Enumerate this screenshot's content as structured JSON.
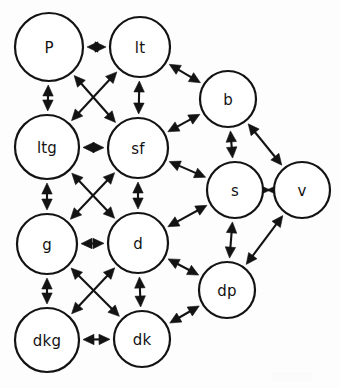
{
  "diagram": {
    "type": "directed-graph",
    "background_color": "#ffffff",
    "stroke_color": "#131313",
    "node_fill_color": "#ffffff",
    "arrow_style": "double-headed",
    "node_count": 12,
    "edge_count": 27,
    "nodes": [
      {
        "id": "P",
        "label": "P",
        "cx": 49,
        "cy": 47,
        "r": 34
      },
      {
        "id": "lt",
        "label": "lt",
        "cx": 140,
        "cy": 47,
        "r": 30
      },
      {
        "id": "b",
        "label": "b",
        "cx": 228,
        "cy": 99,
        "r": 28
      },
      {
        "id": "ltg",
        "label": "ltg",
        "cx": 47,
        "cy": 147,
        "r": 32
      },
      {
        "id": "sf",
        "label": "sf",
        "cx": 138,
        "cy": 148,
        "r": 30
      },
      {
        "id": "s",
        "label": "s",
        "cx": 235,
        "cy": 190,
        "r": 28
      },
      {
        "id": "v",
        "label": "v",
        "cx": 302,
        "cy": 190,
        "r": 28
      },
      {
        "id": "g",
        "label": "g",
        "cx": 47,
        "cy": 244,
        "r": 30
      },
      {
        "id": "d",
        "label": "d",
        "cx": 138,
        "cy": 243,
        "r": 30
      },
      {
        "id": "dp",
        "label": "dp",
        "cx": 227,
        "cy": 290,
        "r": 28
      },
      {
        "id": "dkg",
        "label": "dkg",
        "cx": 47,
        "cy": 340,
        "r": 32
      },
      {
        "id": "dk",
        "label": "dk",
        "cx": 142,
        "cy": 339,
        "r": 28
      }
    ],
    "edges": [
      {
        "from": "P",
        "to": "lt"
      },
      {
        "from": "P",
        "to": "ltg"
      },
      {
        "from": "P",
        "to": "sf"
      },
      {
        "from": "lt",
        "to": "ltg"
      },
      {
        "from": "lt",
        "to": "sf"
      },
      {
        "from": "lt",
        "to": "b"
      },
      {
        "from": "ltg",
        "to": "sf"
      },
      {
        "from": "ltg",
        "to": "g"
      },
      {
        "from": "ltg",
        "to": "d"
      },
      {
        "from": "sf",
        "to": "b"
      },
      {
        "from": "sf",
        "to": "s"
      },
      {
        "from": "sf",
        "to": "g"
      },
      {
        "from": "sf",
        "to": "d"
      },
      {
        "from": "b",
        "to": "s"
      },
      {
        "from": "b",
        "to": "v"
      },
      {
        "from": "s",
        "to": "v"
      },
      {
        "from": "s",
        "to": "d"
      },
      {
        "from": "s",
        "to": "dp"
      },
      {
        "from": "v",
        "to": "dp"
      },
      {
        "from": "g",
        "to": "d"
      },
      {
        "from": "g",
        "to": "dkg"
      },
      {
        "from": "g",
        "to": "dk"
      },
      {
        "from": "d",
        "to": "dp"
      },
      {
        "from": "d",
        "to": "dkg"
      },
      {
        "from": "d",
        "to": "dk"
      },
      {
        "from": "dkg",
        "to": "dk"
      },
      {
        "from": "dk",
        "to": "dp"
      }
    ]
  }
}
